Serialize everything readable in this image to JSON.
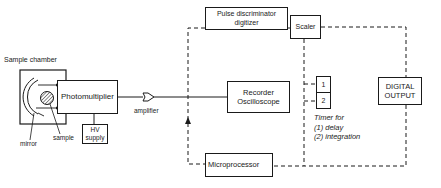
{
  "diagram": {
    "type": "block-diagram",
    "blocks": {
      "sample_chamber": "Sample chamber",
      "photomultiplier": "Photomultiplier",
      "hv_supply_line1": "HV",
      "hv_supply_line2": "supply",
      "pulse_disc_line1": "Pulse discriminator",
      "pulse_disc_line2": "digitizer",
      "scaler": "Scaler",
      "recorder_line1": "Recorder",
      "recorder_line2": "Oscilloscope",
      "timer_1": "1",
      "timer_2": "2",
      "digital_output_line1": "DIGITAL",
      "digital_output_line2": "OUTPUT",
      "microprocessor": "Microprocessor"
    },
    "labels": {
      "mirror": "mirror",
      "sample": "sample",
      "amplifier": "amplifier",
      "timer_line1": "Timer for",
      "timer_line2": "(1) delay",
      "timer_line3": "(2) integration"
    },
    "colors": {
      "line": "#1a1a1a",
      "background": "#ffffff"
    }
  }
}
